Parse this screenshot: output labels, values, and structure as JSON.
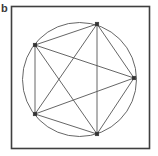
{
  "figure": {
    "panel_label": "b",
    "caption_text": "b",
    "width": 158,
    "height": 156,
    "background_color": "#ffffff"
  },
  "panel_frame": {
    "name": "panel-border",
    "x": 11.5,
    "y": 6.5,
    "width": 138,
    "height": 142,
    "stroke_color": "#3f3f3f",
    "stroke_width": 1.6,
    "fill": "none"
  },
  "diagram": {
    "type": "graph",
    "node_count": 5,
    "edge_count": 10,
    "circle": {
      "name": "bounding-circle",
      "cx": 79.5,
      "cy": 79.5,
      "r": 57,
      "stroke_color": "#555555",
      "stroke_width": 0.9,
      "fill": "none"
    },
    "node_style": {
      "shape": "square",
      "size": 3.6,
      "fill_color": "#333333",
      "stroke_color": "#333333"
    },
    "edge_style": {
      "stroke_color": "#555555",
      "stroke_width": 0.9
    },
    "nodes": [
      {
        "id": "n1",
        "label": "top",
        "x": 97,
        "y": 24
      },
      {
        "id": "n2",
        "label": "upper-left",
        "x": 35,
        "y": 45
      },
      {
        "id": "n3",
        "label": "right",
        "x": 134,
        "y": 78
      },
      {
        "id": "n4",
        "label": "lower-left",
        "x": 35,
        "y": 114
      },
      {
        "id": "n5",
        "label": "bottom",
        "x": 97,
        "y": 134
      }
    ],
    "edges": [
      {
        "id": "e1",
        "from": "n1",
        "to": "n2",
        "x1": 97,
        "y1": 24,
        "x2": 35,
        "y2": 45
      },
      {
        "id": "e2",
        "from": "n1",
        "to": "n3",
        "x1": 97,
        "y1": 24,
        "x2": 134,
        "y2": 78
      },
      {
        "id": "e3",
        "from": "n1",
        "to": "n4",
        "x1": 97,
        "y1": 24,
        "x2": 35,
        "y2": 114
      },
      {
        "id": "e4",
        "from": "n1",
        "to": "n5",
        "x1": 97,
        "y1": 24,
        "x2": 97,
        "y2": 134
      },
      {
        "id": "e5",
        "from": "n2",
        "to": "n3",
        "x1": 35,
        "y1": 45,
        "x2": 134,
        "y2": 78
      },
      {
        "id": "e6",
        "from": "n2",
        "to": "n4",
        "x1": 35,
        "y1": 45,
        "x2": 35,
        "y2": 114
      },
      {
        "id": "e7",
        "from": "n2",
        "to": "n5",
        "x1": 35,
        "y1": 45,
        "x2": 97,
        "y2": 134
      },
      {
        "id": "e8",
        "from": "n3",
        "to": "n4",
        "x1": 134,
        "y1": 78,
        "x2": 35,
        "y2": 114
      },
      {
        "id": "e9",
        "from": "n3",
        "to": "n5",
        "x1": 134,
        "y1": 78,
        "x2": 97,
        "y2": 134
      },
      {
        "id": "e10",
        "from": "n4",
        "to": "n5",
        "x1": 35,
        "y1": 114,
        "x2": 97,
        "y2": 134
      }
    ]
  }
}
